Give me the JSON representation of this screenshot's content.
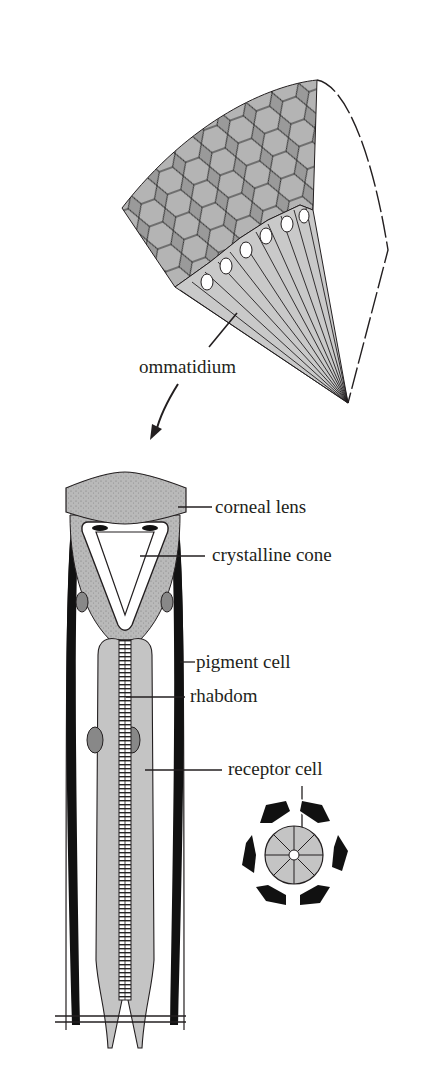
{
  "diagram": {
    "colors": {
      "ink": "#231f20",
      "tissue": "#bdbdbd",
      "lens": "#a9a9a9",
      "pigment": "#111111",
      "paper": "#ffffff"
    },
    "labels": {
      "ommatidium": "ommatidium",
      "corneal_lens": "corneal lens",
      "crystalline_cone": "crystalline cone",
      "pigment_cell": "pigment cell",
      "rhabdom": "rhabdom",
      "receptor_cell": "receptor cell"
    },
    "parts": {
      "compound_eye": "compound-eye-wedge",
      "longitudinal_section": "ommatidium-longitudinal-section",
      "cross_section": "ommatidium-cross-section"
    }
  }
}
